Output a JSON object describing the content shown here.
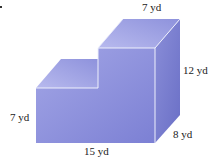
{
  "figure": {
    "type": "3d stepped solid (L-shaped prism)",
    "labels": {
      "top_width": "7 yd",
      "height": "12 yd",
      "step_height": "7 yd",
      "length": "15 yd",
      "depth": "8 yd"
    },
    "colors": {
      "front": "#8f93dd",
      "top": "#a9acea",
      "side": "#7176cc",
      "edge": "#e6e8fb"
    }
  }
}
